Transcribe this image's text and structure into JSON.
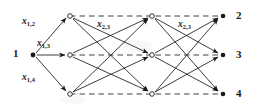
{
  "figure": {
    "type": "trellis-diagram",
    "width": 257,
    "height": 106,
    "background": "#ffffff",
    "ink_color": "#1a1a1a"
  },
  "nodes": {
    "source": {
      "id": "source-1",
      "label": "1",
      "x": 33,
      "y": 55,
      "style": "filled-dot"
    },
    "columns": [
      {
        "index": 1,
        "x": 70,
        "style": "open-circle",
        "rows": [
          {
            "row": 1,
            "y": 16
          },
          {
            "row": 2,
            "y": 55
          },
          {
            "row": 3,
            "y": 94
          }
        ]
      },
      {
        "index": 2,
        "x": 152,
        "style": "open-circle",
        "rows": [
          {
            "row": 1,
            "y": 16
          },
          {
            "row": 2,
            "y": 55
          },
          {
            "row": 3,
            "y": 94
          }
        ]
      },
      {
        "index": 3,
        "x": 222,
        "style": "filled-dot",
        "rows": [
          {
            "row": 1,
            "y": 16
          },
          {
            "row": 2,
            "y": 55
          },
          {
            "row": 3,
            "y": 94
          }
        ]
      }
    ]
  },
  "terminal_labels": [
    {
      "text": "2",
      "x": 236,
      "y": 10
    },
    {
      "text": "3",
      "x": 236,
      "y": 49
    },
    {
      "text": "4",
      "x": 236,
      "y": 88
    }
  ],
  "edge_labels": [
    {
      "name": "x-1-2",
      "base": "x",
      "sub": "1,2",
      "x": 22,
      "y": 22
    },
    {
      "name": "x-1-3",
      "base": "x",
      "sub": "1,3",
      "x": 37,
      "y": 44
    },
    {
      "name": "x-1-4",
      "base": "x",
      "sub": "1,4",
      "x": 22,
      "y": 78
    },
    {
      "name": "x-2-3-a",
      "base": "x",
      "sub": "2,3",
      "x": 97,
      "y": 13
    },
    {
      "name": "x-2-3-b",
      "base": "x",
      "sub": "2,3",
      "x": 178,
      "y": 13
    }
  ],
  "dashed_rows": [
    {
      "row": 1,
      "y": 16,
      "x1": 70,
      "x2": 222
    },
    {
      "row": 2,
      "y": 55,
      "x1": 70,
      "x2": 222
    },
    {
      "row": 3,
      "y": 94,
      "x1": 70,
      "x2": 222
    }
  ],
  "fanout_edges": [
    {
      "from": "source-1",
      "to": "c1-r1"
    },
    {
      "from": "source-1",
      "to": "c1-r2"
    },
    {
      "from": "source-1",
      "to": "c1-r3"
    }
  ],
  "stage_edges": [
    {
      "stage": 1,
      "from_row": 1,
      "to_row": 2
    },
    {
      "stage": 1,
      "from_row": 1,
      "to_row": 3
    },
    {
      "stage": 1,
      "from_row": 2,
      "to_row": 1
    },
    {
      "stage": 1,
      "from_row": 2,
      "to_row": 3
    },
    {
      "stage": 1,
      "from_row": 3,
      "to_row": 1
    },
    {
      "stage": 1,
      "from_row": 3,
      "to_row": 2
    },
    {
      "stage": 2,
      "from_row": 1,
      "to_row": 2
    },
    {
      "stage": 2,
      "from_row": 1,
      "to_row": 3
    },
    {
      "stage": 2,
      "from_row": 2,
      "to_row": 1
    },
    {
      "stage": 2,
      "from_row": 2,
      "to_row": 3
    },
    {
      "stage": 2,
      "from_row": 3,
      "to_row": 1
    },
    {
      "stage": 2,
      "from_row": 3,
      "to_row": 2
    }
  ]
}
